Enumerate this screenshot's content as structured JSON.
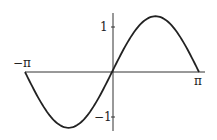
{
  "chart_data": {
    "type": "line",
    "title": "",
    "xlabel": "",
    "ylabel": "",
    "x_ticks": [
      "-π",
      "π"
    ],
    "y_ticks": [
      "1",
      "-1"
    ],
    "xlim": [
      -3.1416,
      3.1416
    ],
    "ylim": [
      -1.3,
      1.3
    ],
    "grid": false,
    "series": [
      {
        "name": "f(x)",
        "x": [
          -3.1416,
          -2.3562,
          -1.5708,
          -0.7854,
          0,
          0.7854,
          1.5708,
          2.3562,
          3.1416
        ],
        "values": [
          0,
          -0.88,
          -1.24,
          -0.88,
          0,
          0.88,
          1.24,
          0.88,
          0
        ]
      }
    ]
  },
  "labels": {
    "x_min": "−π",
    "x_max": "π",
    "y_pos": "1",
    "y_neg": "−1"
  },
  "colors": {
    "curve": "#222222",
    "axis": "#333333"
  }
}
